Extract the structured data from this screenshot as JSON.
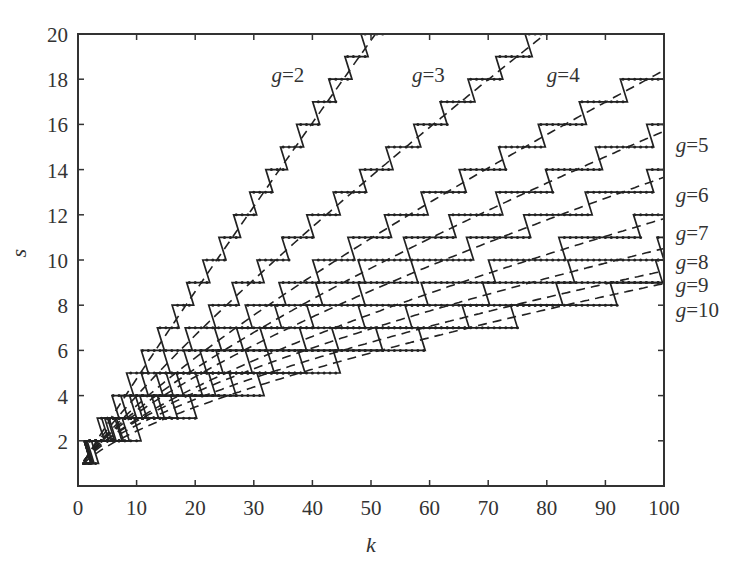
{
  "chart_data": {
    "type": "line",
    "title": "",
    "xlabel": "k",
    "ylabel": "s",
    "xlim": [
      0,
      100
    ],
    "ylim": [
      0,
      20
    ],
    "xticks": [
      0,
      10,
      20,
      30,
      40,
      50,
      60,
      70,
      80,
      90,
      100
    ],
    "yticks": [
      2,
      4,
      6,
      8,
      10,
      12,
      14,
      16,
      18,
      20
    ],
    "grid": false,
    "legend": "inline labels",
    "series": [
      {
        "name": "g=2",
        "g": 2,
        "fit": {
          "a": 0.465,
          "p": 0.95
        },
        "k_end": 53,
        "label_pos": [
          33,
          18.2
        ],
        "dashed_at_k": {
          "20": 8.0,
          "52": 19.8
        }
      },
      {
        "name": "g=3",
        "g": 3,
        "fit": {
          "a": 0.49,
          "p": 0.84
        },
        "k_end": 80,
        "label_pos": [
          57,
          18.2
        ],
        "dashed_at_k": {
          "40": 11.0,
          "79": 19.5
        }
      },
      {
        "name": "g=4",
        "g": 4,
        "fit": {
          "a": 0.49,
          "p": 0.78
        },
        "k_end": 100,
        "label_pos": [
          80,
          18.2
        ],
        "dashed_at_k": {
          "50": 10.5,
          "100": 18.0
        }
      },
      {
        "name": "g=5",
        "g": 5,
        "fit": {
          "a": 0.5,
          "p": 0.74
        },
        "k_end": 100,
        "label_pos": [
          102,
          15.1
        ],
        "dashed_at_k": {
          "50": 9.0,
          "100": 15.0
        }
      },
      {
        "name": "g=6",
        "g": 6,
        "fit": {
          "a": 0.52,
          "p": 0.7
        },
        "k_end": 100,
        "label_pos": [
          102,
          12.9
        ],
        "dashed_at_k": {
          "50": 8.0,
          "100": 13.0
        }
      },
      {
        "name": "g=7",
        "g": 7,
        "fit": {
          "a": 0.49,
          "p": 0.68
        },
        "k_end": 100,
        "label_pos": [
          102,
          11.2
        ],
        "dashed_at_k": {
          "50": 7.0,
          "100": 11.2
        }
      },
      {
        "name": "g=8",
        "g": 8,
        "fit": {
          "a": 0.52,
          "p": 0.64
        },
        "k_end": 100,
        "label_pos": [
          102,
          9.9
        ],
        "dashed_at_k": {
          "50": 6.4,
          "100": 10.0
        }
      },
      {
        "name": "g=9",
        "g": 9,
        "fit": {
          "a": 0.49,
          "p": 0.63
        },
        "k_end": 100,
        "label_pos": [
          102,
          8.9
        ],
        "dashed_at_k": {
          "50": 5.8,
          "100": 9.0
        }
      },
      {
        "name": "g=10",
        "g": 10,
        "fit": {
          "a": 0.4,
          "p": 0.66
        },
        "k_end": 100,
        "label_pos": [
          102,
          7.8
        ],
        "dashed_at_k": {
          "50": 5.3,
          "100": 8.4
        }
      }
    ]
  }
}
